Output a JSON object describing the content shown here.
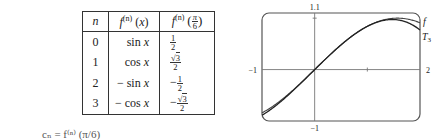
{
  "table": {
    "headers": {
      "n": "n",
      "fn_x_base": "f",
      "fn_x_sup": "(n)",
      "fn_x_arg": "(x)",
      "fn_pi6_base": "f",
      "fn_pi6_sup": "(n)",
      "fn_pi6_num": "π",
      "fn_pi6_den": "6"
    },
    "rows": [
      {
        "n": "0",
        "sign": "",
        "func": "sin",
        "var": "x",
        "val_sign": "",
        "val_num": "1",
        "val_sqrt": false,
        "val_den": "2"
      },
      {
        "n": "1",
        "sign": "",
        "func": "cos",
        "var": "x",
        "val_sign": "",
        "val_num": "3",
        "val_sqrt": true,
        "val_den": "2"
      },
      {
        "n": "2",
        "sign": "− ",
        "func": "sin",
        "var": "x",
        "val_sign": "−",
        "val_num": "1",
        "val_sqrt": false,
        "val_den": "2"
      },
      {
        "n": "3",
        "sign": "− ",
        "func": "cos",
        "var": "x",
        "val_sign": "−",
        "val_num": "3",
        "val_sqrt": true,
        "val_den": "2"
      }
    ]
  },
  "bottom_text": "cₙ = f⁽ⁿ⁾ (π/6)",
  "chart_data": {
    "type": "line",
    "title": "",
    "xlim": [
      -1,
      2
    ],
    "ylim": [
      -1,
      1.1
    ],
    "tick_labels": {
      "x_left": "−1",
      "x_right": "2",
      "y_top": "1.1",
      "y_bottom": "−1"
    },
    "x_ticks": [
      1
    ],
    "y_ticks": [
      1
    ],
    "series": [
      {
        "name": "f",
        "label": "f",
        "expr": "sin(x)"
      },
      {
        "name": "T3",
        "label": "T",
        "label_sub": "3",
        "expr": "1/2 + (√3/2)(x−π/6) − (1/4)(x−π/6)² − (√3/12)(x−π/6)³"
      }
    ],
    "grid": false,
    "legend": "inline labels at right end of curves"
  }
}
